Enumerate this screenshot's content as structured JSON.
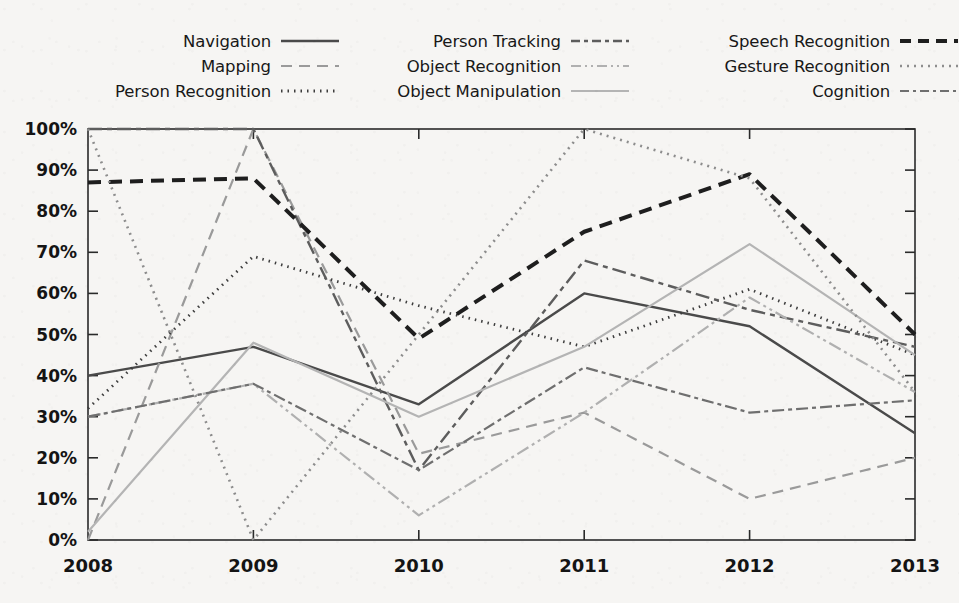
{
  "chart_data": {
    "type": "line",
    "title": "",
    "subtitle": "",
    "xlabel": "",
    "ylabel": "",
    "x": [
      "2008",
      "2009",
      "2010",
      "2011",
      "2012",
      "2013"
    ],
    "categories": [
      "2008",
      "2009",
      "2010",
      "2011",
      "2012",
      "2013"
    ],
    "xtick_labels": [
      "2008",
      "2009",
      "2010",
      "2011",
      "2012",
      "2013"
    ],
    "ytick_labels": [
      "0%",
      "10%",
      "20%",
      "30%",
      "40%",
      "50%",
      "60%",
      "70%",
      "80%",
      "90%",
      "100%"
    ],
    "ytick_values": [
      0,
      10,
      20,
      30,
      40,
      50,
      60,
      70,
      80,
      90,
      100
    ],
    "ylim": [
      0,
      100
    ],
    "yunit": "%",
    "grid": false,
    "legend_position": "top",
    "legend_columns": 3,
    "series": [
      {
        "name": "Navigation",
        "values": [
          40,
          47,
          33,
          60,
          52,
          26
        ],
        "style": "solid",
        "color": "#4a4a4a",
        "width": 2.4,
        "dash": "",
        "legend_column": 0,
        "legend_row": 0
      },
      {
        "name": "Mapping",
        "values": [
          0,
          100,
          21,
          31,
          10,
          20
        ],
        "style": "dashed",
        "color": "#9a9a9a",
        "width": 2.2,
        "dash": "11 7",
        "legend_column": 0,
        "legend_row": 1
      },
      {
        "name": "Person Recognition",
        "values": [
          32,
          69,
          57,
          47,
          61,
          45
        ],
        "style": "dotted",
        "color": "#3d3d3d",
        "width": 2.8,
        "dash": "1.5 5",
        "legend_column": 0,
        "legend_row": 2
      },
      {
        "name": "Person Tracking",
        "values": [
          100,
          100,
          17,
          68,
          56,
          47
        ],
        "style": "dash-dot",
        "color": "#5d5d5d",
        "width": 2.4,
        "dash": "14 5 5 5",
        "legend_column": 1,
        "legend_row": 0
      },
      {
        "name": "Object Recognition",
        "values": [
          30,
          38,
          6,
          31,
          59,
          36
        ],
        "style": "dash-dot-dot",
        "color": "#b0b0b0",
        "width": 2.2,
        "dash": "13 4 3 4 3 4",
        "legend_column": 1,
        "legend_row": 1
      },
      {
        "name": "Object Manipulation",
        "values": [
          2,
          48,
          30,
          47,
          72,
          45
        ],
        "style": "solid",
        "color": "#b4b4b4",
        "width": 2.2,
        "dash": "",
        "legend_column": 1,
        "legend_row": 2
      },
      {
        "name": "Speech Recognition",
        "values": [
          87,
          88,
          49,
          75,
          89,
          50
        ],
        "style": "bold-dashed",
        "color": "#1e1e1e",
        "width": 4.0,
        "dash": "13 8",
        "legend_column": 2,
        "legend_row": 0
      },
      {
        "name": "Gesture Recognition",
        "values": [
          100,
          0,
          50,
          100,
          88,
          36
        ],
        "style": "dotted",
        "color": "#8d8d8d",
        "width": 2.6,
        "dash": "2 5",
        "legend_column": 2,
        "legend_row": 1
      },
      {
        "name": "Cognition",
        "values": [
          30,
          38,
          17,
          42,
          31,
          34
        ],
        "style": "dash-dot",
        "color": "#6f6f6f",
        "width": 2.2,
        "dash": "12 4 4 4",
        "legend_column": 2,
        "legend_row": 2
      }
    ],
    "colors": {
      "background": "#f6f5f3",
      "axis": "#2a2a2a",
      "text": "#141414"
    }
  }
}
